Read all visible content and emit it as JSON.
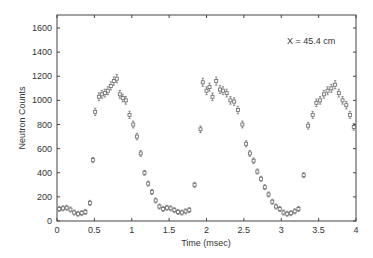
{
  "chart_data": {
    "type": "scatter",
    "title": "",
    "xlabel": "Time (msec)",
    "ylabel": "Neutron Counts",
    "xlim": [
      0,
      4
    ],
    "ylim": [
      0,
      1700
    ],
    "xticks": [
      0,
      0.5,
      1,
      1.5,
      2,
      2.5,
      3,
      3.5,
      4
    ],
    "xtick_labels": [
      "0",
      "0.5",
      "1",
      "1.5",
      "2",
      "2.5",
      "3",
      "3.5",
      "4"
    ],
    "yticks": [
      0,
      200,
      400,
      600,
      800,
      1000,
      1200,
      1400,
      1600
    ],
    "ytick_labels": [
      "0",
      "200",
      "400",
      "600",
      "800",
      "1000",
      "1200",
      "1400",
      "1600"
    ],
    "grid": false,
    "legend": null,
    "annotations": [
      {
        "text": "X = 45.4 cm",
        "x": 3.3,
        "y": 1450
      }
    ],
    "marker": "open-square-with-errorbar",
    "series": [
      {
        "name": "Neutron counts",
        "x": [
          0.03,
          0.08,
          0.13,
          0.18,
          0.23,
          0.28,
          0.33,
          0.38,
          0.44,
          0.48,
          0.51,
          0.56,
          0.6,
          0.64,
          0.68,
          0.72,
          0.76,
          0.8,
          0.84,
          0.88,
          0.92,
          0.97,
          1.02,
          1.07,
          1.12,
          1.17,
          1.22,
          1.27,
          1.32,
          1.37,
          1.42,
          1.47,
          1.52,
          1.57,
          1.62,
          1.67,
          1.72,
          1.77,
          1.84,
          1.92,
          1.95,
          2.0,
          2.04,
          2.08,
          2.13,
          2.18,
          2.22,
          2.27,
          2.32,
          2.37,
          2.42,
          2.48,
          2.53,
          2.58,
          2.63,
          2.68,
          2.73,
          2.78,
          2.83,
          2.88,
          2.93,
          2.98,
          3.03,
          3.08,
          3.13,
          3.18,
          3.23,
          3.3,
          3.36,
          3.42,
          3.47,
          3.52,
          3.57,
          3.62,
          3.67,
          3.72,
          3.77,
          3.82,
          3.87,
          3.92,
          3.97
        ],
        "y": [
          100,
          105,
          110,
          95,
          70,
          60,
          65,
          75,
          150,
          505,
          905,
          1030,
          1050,
          1060,
          1080,
          1120,
          1160,
          1180,
          1050,
          1020,
          1000,
          880,
          800,
          700,
          560,
          400,
          310,
          240,
          170,
          120,
          100,
          110,
          105,
          90,
          75,
          70,
          80,
          90,
          300,
          760,
          1150,
          1080,
          1110,
          1030,
          1160,
          1090,
          1080,
          1060,
          1000,
          990,
          920,
          800,
          640,
          560,
          500,
          410,
          350,
          280,
          220,
          160,
          120,
          100,
          70,
          60,
          65,
          80,
          100,
          380,
          790,
          880,
          980,
          1000,
          1050,
          1080,
          1100,
          1130,
          1060,
          1000,
          960,
          880,
          780
        ]
      }
    ]
  }
}
